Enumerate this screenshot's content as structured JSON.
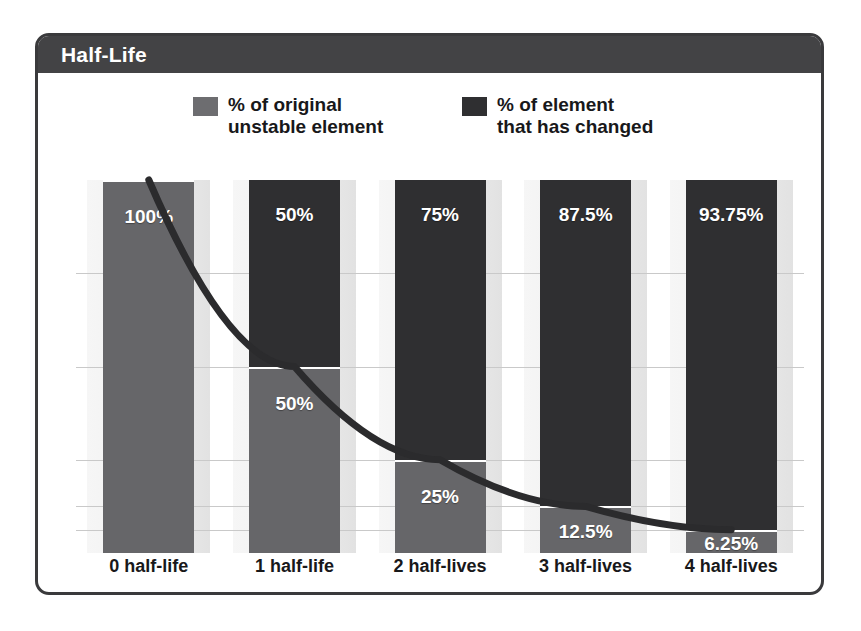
{
  "header": {
    "title": "Half-Life"
  },
  "legend": {
    "items": [
      {
        "name": "original-unstable",
        "label": "% of original\nunstable element",
        "color": "#6d6d70"
      },
      {
        "name": "changed",
        "label": "% of element\nthat has changed",
        "color": "#2f2f31"
      }
    ]
  },
  "chart_data": {
    "type": "bar",
    "title": "Half-Life",
    "stacked": true,
    "xlabel": "",
    "ylabel": "",
    "ylim": [
      0,
      100
    ],
    "grid": true,
    "legend_position": "top",
    "categories": [
      "0 half-life",
      "1 half-life",
      "2 half-lives",
      "3 half-lives",
      "4 half-lives"
    ],
    "series": [
      {
        "name": "% of element that has changed",
        "color": "#2f2f31",
        "values": [
          0,
          50,
          75,
          87.5,
          93.75
        ],
        "labels": [
          "",
          "50%",
          "75%",
          "87.5%",
          "93.75%"
        ]
      },
      {
        "name": "% of original unstable element",
        "color": "#6d6d70",
        "values": [
          100,
          50,
          25,
          12.5,
          6.25
        ],
        "labels": [
          "100%",
          "50%",
          "25%",
          "12.5%",
          "6.25%"
        ]
      }
    ],
    "decay_curve": {
      "name": "decay-curve",
      "color": "#2b2b2d",
      "x": [
        "0 half-life",
        "1 half-life",
        "2 half-lives",
        "3 half-lives",
        "4 half-lives"
      ],
      "y": [
        100,
        50,
        25,
        12.5,
        6.25
      ]
    },
    "gridline_values": [
      75,
      50,
      25,
      12.5,
      6.25
    ]
  }
}
